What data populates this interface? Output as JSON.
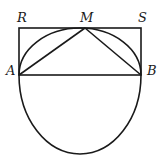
{
  "diagram": {
    "type": "geometry",
    "labels": {
      "R": "R",
      "M": "M",
      "S": "S",
      "A": "A",
      "B": "B"
    },
    "points": {
      "R": [
        19,
        28
      ],
      "S": [
        141,
        28
      ],
      "A": [
        19,
        75
      ],
      "B": [
        141,
        75
      ],
      "M": [
        85,
        28
      ]
    },
    "circle": {
      "center": [
        80,
        75
      ],
      "diameter_endpoints": [
        "A",
        "B"
      ],
      "horizontal_radius": 61,
      "upper_vertical_extent": 47,
      "lower_vertical_extent": 79,
      "is_true_circle_in_source": false
    },
    "segments": [
      [
        "R",
        "S"
      ],
      [
        "R",
        "A"
      ],
      [
        "S",
        "B"
      ],
      [
        "A",
        "B"
      ],
      [
        "M",
        "A"
      ],
      [
        "M",
        "B"
      ]
    ],
    "colors": {
      "stroke": "#1a1a1a",
      "background": "#ffffff"
    }
  }
}
